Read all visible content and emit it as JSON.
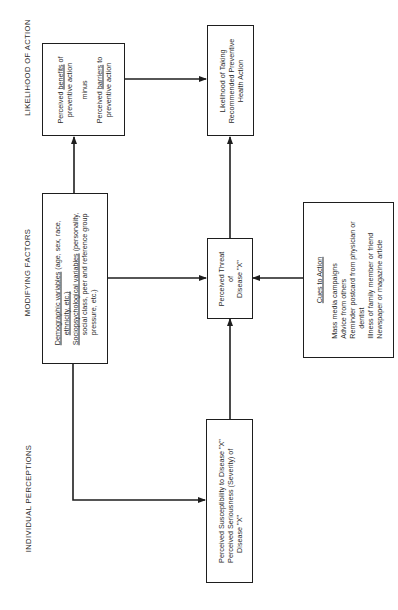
{
  "columns": {
    "individual_perceptions": "INDIVIDUAL PERCEPTIONS",
    "modifying_factors": "MODIFYING FACTORS",
    "likelihood_of_action": "LIKELIHOOD OF ACTION"
  },
  "boxes": {
    "benefits_barriers": {
      "line1_pre": "Perceived ",
      "line1_u": "benefits",
      "line1_post": " of",
      "line2": "preventive action",
      "minus": "minus",
      "line3_pre": "Perceived ",
      "line3_u": "barriers",
      "line3_post": " to",
      "line4": "preventive action"
    },
    "likelihood": {
      "line1": "Likelihood of Taking",
      "line2": "Recommended Preventive",
      "line3": "Health Action"
    },
    "modifying": {
      "demo_u": "Demographic variables",
      "demo_rest": " (age, sex, race,",
      "demo_2": "ethnicity, etc.)",
      "socio_u": "Sociopsychological variables",
      "socio_rest": " (personality,",
      "socio_2": "social class, peer and reference group",
      "socio_3": "pressure, etc.)"
    },
    "threat": {
      "line1": "Perceived Threat",
      "line2": "of",
      "line3": "Disease \"X\""
    },
    "cues": {
      "title": "Cues to Action",
      "items": [
        "Mass media campaigns",
        "Advice from others",
        "Reminder postcard from physician or",
        "dentist",
        "Illness of family member or friend",
        "Newspaper or magazine article"
      ]
    },
    "perceptions": {
      "line1": "Perceived Susceptibility to Disease \"X\"",
      "line2": "Perceived Seriousness (Severity) of",
      "line3": "Disease \"X\""
    }
  },
  "colors": {
    "line": "#1e1e1e",
    "text": "#2a2a2a",
    "background": "#ffffff"
  }
}
